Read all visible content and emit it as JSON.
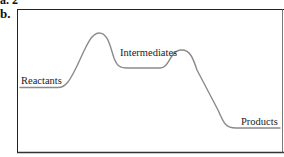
{
  "figure": {
    "partial_label_top": "a. 2",
    "panel_label": "b.",
    "curve_color": "#8a8a8a",
    "frame_color": "#222222",
    "labels": {
      "reactants": "Reactants",
      "intermediates": "Intermediates",
      "products": "Products"
    }
  }
}
